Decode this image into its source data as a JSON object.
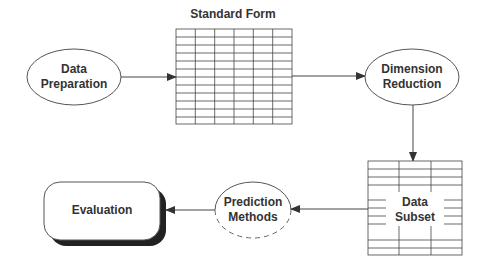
{
  "diagram": {
    "type": "flowchart",
    "colors": {
      "stroke": "#444444",
      "text": "#333333",
      "shadow": "#222222",
      "background": "#ffffff"
    },
    "nodes": {
      "data_preparation": {
        "line1": "Data",
        "line2": "Preparation",
        "shape": "ellipse"
      },
      "standard_form": {
        "title": "Standard Form",
        "shape": "table-grid"
      },
      "dimension_reduction": {
        "line1": "Dimension",
        "line2": "Reduction",
        "shape": "ellipse"
      },
      "data_subset": {
        "line1": "Data",
        "line2": "Subset",
        "shape": "table-grid"
      },
      "prediction_methods": {
        "line1": "Prediction",
        "line2": "Methods",
        "shape": "ellipse-dashed"
      },
      "evaluation": {
        "label": "Evaluation",
        "shape": "rounded-box-shadow"
      }
    },
    "edges": [
      {
        "from": "Data Preparation",
        "to": "Standard Form"
      },
      {
        "from": "Standard Form",
        "to": "Dimension Reduction"
      },
      {
        "from": "Dimension Reduction",
        "to": "Data Subset"
      },
      {
        "from": "Data Subset",
        "to": "Prediction Methods"
      },
      {
        "from": "Prediction Methods",
        "to": "Evaluation"
      }
    ]
  }
}
